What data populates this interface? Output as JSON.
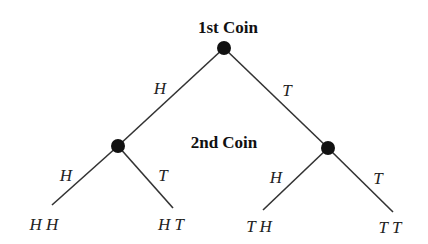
{
  "titles": {
    "first": "1st Coin",
    "second": "2nd Coin"
  },
  "branches": {
    "root_left": "H",
    "root_right": "T",
    "left_left": "H",
    "left_right": "T",
    "right_left": "H",
    "right_right": "T"
  },
  "outcomes": [
    "H H",
    "H T",
    "T H",
    "T T"
  ]
}
